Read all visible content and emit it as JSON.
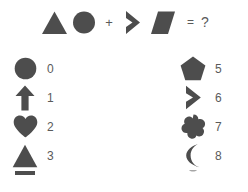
{
  "puzzle": {
    "type": "shape-arithmetic-puzzle",
    "equation": {
      "operand1": {
        "shapes": [
          "triangle",
          "circle"
        ],
        "digits": "30"
      },
      "operator": "+",
      "operand2": {
        "shapes": [
          "chevron",
          "parallelogram"
        ],
        "digits": "6?"
      },
      "equals": "=",
      "answer": "?"
    },
    "legend": {
      "left_column": [
        {
          "shape": "circle",
          "value": "0"
        },
        {
          "shape": "arrow-up",
          "value": "1"
        },
        {
          "shape": "heart",
          "value": "2"
        },
        {
          "shape": "triangle",
          "value": "3"
        },
        {
          "shape": "bar",
          "value": ""
        }
      ],
      "right_column": [
        {
          "shape": "pentagon",
          "value": "5"
        },
        {
          "shape": "chevron",
          "value": "6"
        },
        {
          "shape": "quatrefoil",
          "value": "7"
        },
        {
          "shape": "crescent",
          "value": "8"
        },
        {
          "shape": "partial",
          "value": ""
        }
      ]
    }
  },
  "colors": {
    "shape": "#4d4d4d",
    "text": "#5a5a5a",
    "background": "#ffffff"
  }
}
